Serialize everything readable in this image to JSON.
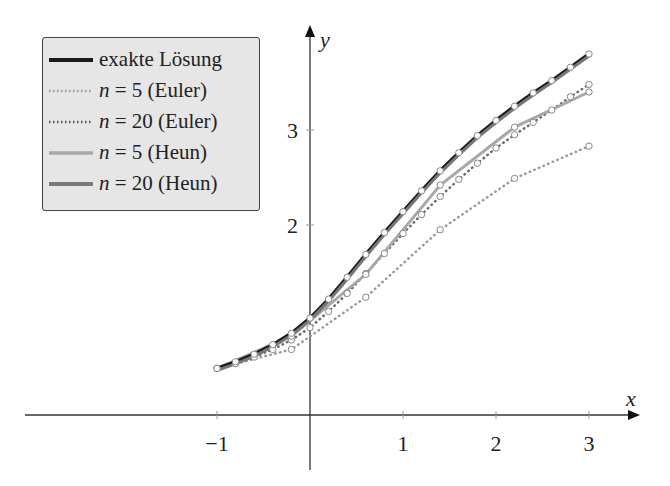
{
  "chart_data": {
    "type": "line",
    "title": "",
    "xlabel": "x",
    "ylabel": "y",
    "xlim": [
      -1.9,
      3.5
    ],
    "ylim": [
      0,
      3.95
    ],
    "x_ticks": [
      -1,
      1,
      2,
      3
    ],
    "x_tick_labels": [
      "−1",
      "1",
      "2",
      "3"
    ],
    "y_ticks": [
      2,
      3
    ],
    "y_tick_labels": [
      "2",
      "3"
    ],
    "grid": false,
    "legend_position": "upper left",
    "series": [
      {
        "name": "exakte Lösung",
        "style": "solid",
        "color": "#1a1a1a",
        "width": 3.5,
        "x": [
          -1,
          -0.8,
          -0.6,
          -0.4,
          -0.2,
          0,
          0.2,
          0.4,
          0.6,
          0.8,
          1,
          1.2,
          1.4,
          1.6,
          1.8,
          2,
          2.2,
          2.4,
          2.6,
          2.8,
          3
        ],
        "y": [
          0.49,
          0.56,
          0.64,
          0.74,
          0.86,
          1.02,
          1.22,
          1.45,
          1.69,
          1.92,
          2.14,
          2.36,
          2.57,
          2.76,
          2.94,
          3.1,
          3.25,
          3.39,
          3.52,
          3.66,
          3.8
        ]
      },
      {
        "name": "n = 5 (Euler)",
        "style": "dotted",
        "color": "#9a9a9a",
        "width": 2.5,
        "x": [
          -1,
          -0.2,
          0.6,
          1.4,
          2.2,
          3
        ],
        "y": [
          0.49,
          0.69,
          1.24,
          1.95,
          2.49,
          2.83
        ]
      },
      {
        "name": "n = 20 (Euler)",
        "style": "dotted",
        "color": "#6a6a6a",
        "width": 2.5,
        "x": [
          -1,
          -0.8,
          -0.6,
          -0.4,
          -0.2,
          0,
          0.2,
          0.4,
          0.6,
          0.8,
          1,
          1.2,
          1.4,
          1.6,
          1.8,
          2,
          2.2,
          2.4,
          2.6,
          2.8,
          3
        ],
        "y": [
          0.49,
          0.54,
          0.61,
          0.69,
          0.79,
          0.92,
          1.09,
          1.28,
          1.49,
          1.7,
          1.91,
          2.11,
          2.3,
          2.48,
          2.65,
          2.81,
          2.95,
          3.08,
          3.21,
          3.35,
          3.48
        ]
      },
      {
        "name": "n = 5 (Heun)",
        "style": "solid",
        "color": "#a8a8a8",
        "width": 3,
        "x": [
          -1,
          -0.2,
          0.6,
          1.4,
          2.2,
          3
        ],
        "y": [
          0.49,
          0.83,
          1.48,
          2.42,
          3.03,
          3.4
        ]
      },
      {
        "name": "n = 20 (Heun)",
        "style": "solid",
        "color": "#7a7a7a",
        "width": 3.5,
        "x": [
          -1,
          -0.8,
          -0.6,
          -0.4,
          -0.2,
          0,
          0.2,
          0.4,
          0.6,
          0.8,
          1,
          1.2,
          1.4,
          1.6,
          1.8,
          2,
          2.2,
          2.4,
          2.6,
          2.8,
          3
        ],
        "y": [
          0.49,
          0.56,
          0.64,
          0.74,
          0.86,
          1.02,
          1.22,
          1.45,
          1.69,
          1.92,
          2.14,
          2.36,
          2.57,
          2.76,
          2.94,
          3.1,
          3.25,
          3.39,
          3.52,
          3.66,
          3.8
        ]
      }
    ]
  },
  "legend": {
    "items": [
      {
        "label_var": "",
        "label": "exakte Lösung"
      },
      {
        "label_var": "n",
        "label": " = 5 (Euler)"
      },
      {
        "label_var": "n",
        "label": " = 20 (Euler)"
      },
      {
        "label_var": "n",
        "label": " = 5 (Heun)"
      },
      {
        "label_var": "n",
        "label": " = 20 (Heun)"
      }
    ]
  }
}
